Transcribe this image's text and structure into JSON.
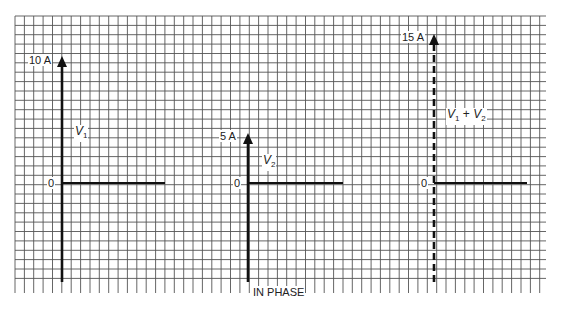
{
  "figure": {
    "caption": "IN PHASE",
    "grid": {
      "left": 15,
      "top": 16,
      "right": 546,
      "bottom": 293,
      "cell": 9.37,
      "color": "#555555"
    },
    "ink_color": "#111111",
    "phasors": [
      {
        "id": "v1",
        "label_main": "V",
        "label_sub": "1",
        "magnitude_label": "10 A",
        "zero_label": "0",
        "magnitude": 10,
        "style": "solid"
      },
      {
        "id": "v2",
        "label_main": "V",
        "label_sub": "2",
        "magnitude_label": "5 A",
        "zero_label": "0",
        "magnitude": 5,
        "style": "solid"
      },
      {
        "id": "sum",
        "label_main": "V",
        "label_sub": "1",
        "label_plus": " + ",
        "label_main2": "V",
        "label_sub2": "2",
        "magnitude_label": "15 A",
        "zero_label": "0",
        "magnitude": 15,
        "style": "dashed"
      }
    ]
  }
}
